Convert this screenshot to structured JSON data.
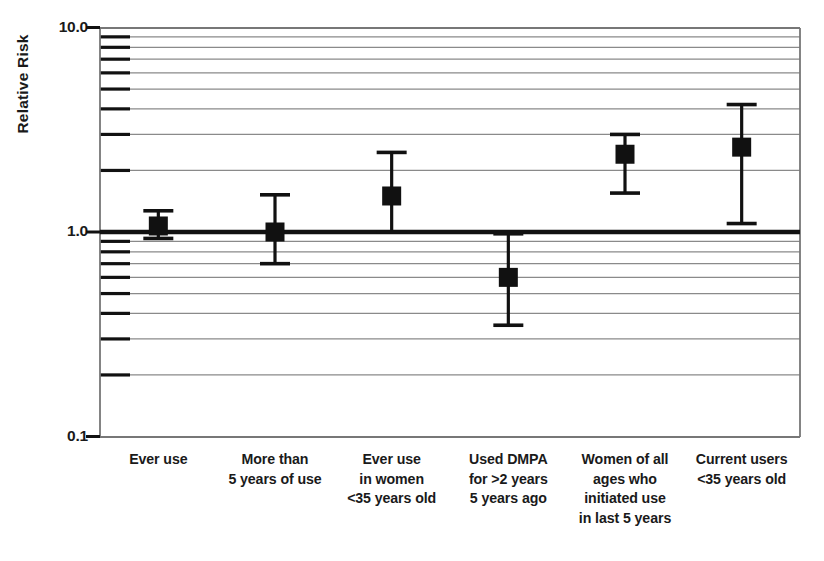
{
  "chart_data": {
    "type": "scatter",
    "title": "",
    "subtitle": "",
    "xlabel": "",
    "ylabel": "Relative Risk",
    "yscale": "log",
    "ylim": [
      0.1,
      10.0
    ],
    "grid": true,
    "legend": null,
    "reference_line": {
      "value": 1.0,
      "label": "1.0"
    },
    "y_major_ticks": [
      "10.0",
      "1.0",
      "0.1"
    ],
    "y_major_values": [
      10.0,
      1.0,
      0.1
    ],
    "y_minor_values": [
      9,
      8,
      7,
      6,
      5,
      4,
      3,
      2,
      0.9,
      0.8,
      0.7,
      0.6,
      0.5,
      0.4,
      0.3,
      0.2
    ],
    "categories": [
      "Ever use",
      "More than 5 years of use",
      "Ever use in women <35 years old",
      "Used DMPA for >2 years 5 years ago",
      "Women of all ages who initiated use in last 5 years",
      "Current users <35 years old"
    ],
    "category_lines": [
      [
        "Ever use"
      ],
      [
        "More than",
        "5 years of use"
      ],
      [
        "Ever use",
        "in women",
        "<35 years old"
      ],
      [
        "Used DMPA",
        "for >2 years",
        "5 years ago"
      ],
      [
        "Women of all",
        "ages who",
        "initiated use",
        "in last 5 years"
      ],
      [
        "Current users",
        "<35 years old"
      ]
    ],
    "values": [
      1.07,
      1.0,
      1.5,
      0.6,
      2.4,
      2.6
    ],
    "ci_low": [
      0.93,
      0.7,
      1.0,
      0.35,
      1.55,
      1.1
    ],
    "ci_high": [
      1.27,
      1.52,
      2.45,
      0.98,
      3.0,
      4.2
    ],
    "marker": "square",
    "marker_color": "#111111",
    "line_color": "#111111"
  },
  "axes": {
    "y_title": "Relative Risk",
    "tick_10": "10.0",
    "tick_1": "1.0",
    "tick_01": "0.1"
  },
  "colors": {
    "ink": "#111111",
    "grid": "#8a8a8a",
    "background": "#ffffff"
  }
}
